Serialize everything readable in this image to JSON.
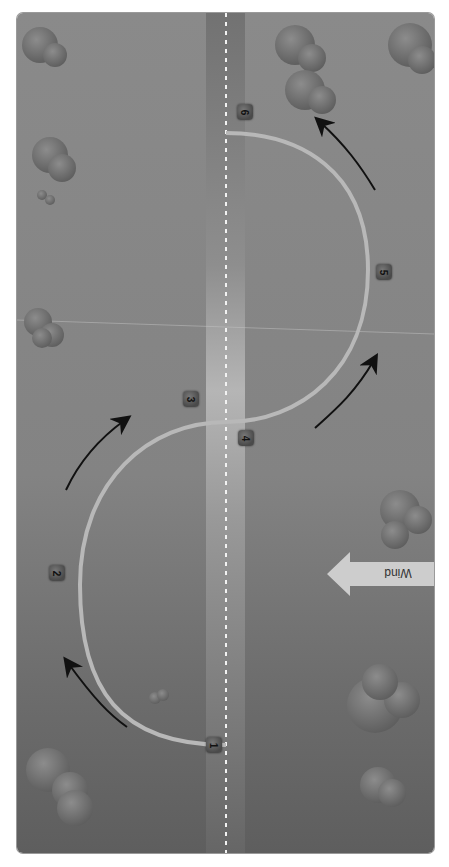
{
  "diagram": {
    "wind_label": "Wind",
    "markers": [
      {
        "id": "1",
        "x": 214,
        "y": 745
      },
      {
        "id": "2",
        "x": 57,
        "y": 573
      },
      {
        "id": "3",
        "x": 191,
        "y": 399
      },
      {
        "id": "4",
        "x": 246,
        "y": 438
      },
      {
        "id": "5",
        "x": 384,
        "y": 272
      },
      {
        "id": "6",
        "x": 245,
        "y": 112
      }
    ],
    "colors": {
      "background": "#858585",
      "runway": "#7a7a7a",
      "path": "#b8b8b8",
      "arrow": "#111111",
      "wind_arrow": "#c9c9c9",
      "marker": "#4a4a4a"
    },
    "caption": ""
  }
}
